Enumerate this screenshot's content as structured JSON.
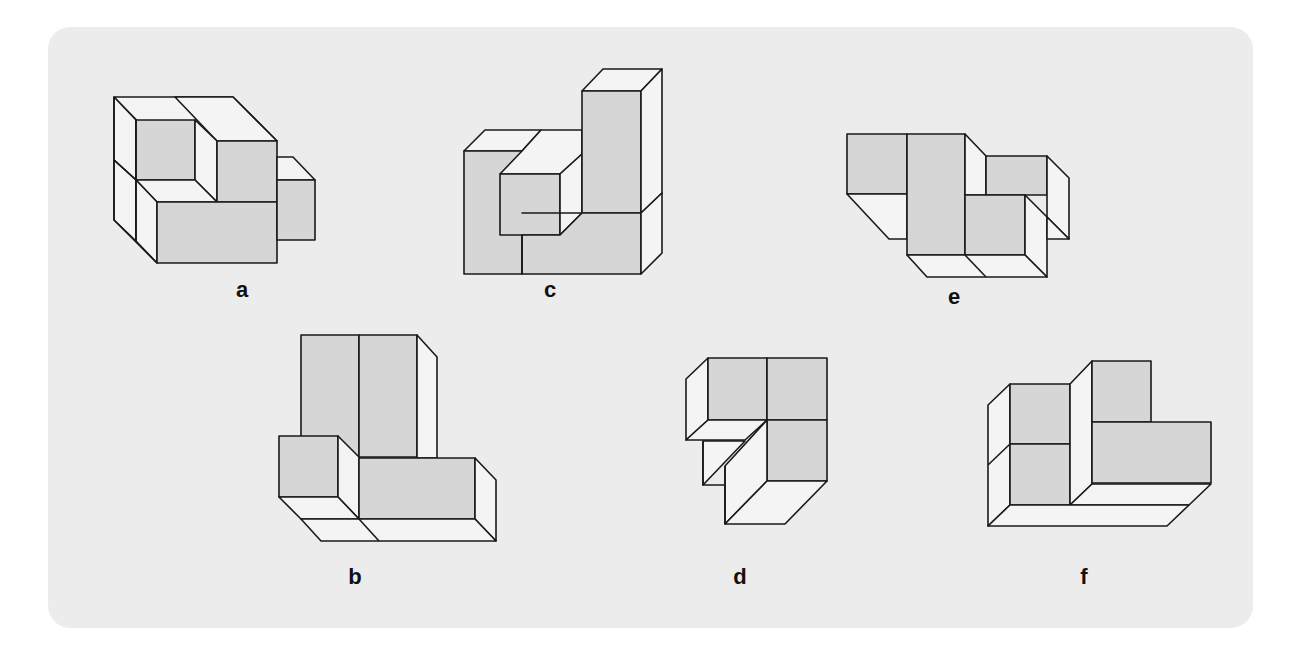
{
  "colors": {
    "panel": "#ececec",
    "gray_face": "#d6d6d6",
    "white_face": "#f4f4f4",
    "stroke": "#1a1a1a"
  },
  "figures": [
    {
      "id": "a",
      "label": "a",
      "label_pos": [
        242,
        290
      ],
      "faces": [
        {
          "fill": "white",
          "pts": "114,97 233,97 277,141 157,141"
        },
        {
          "fill": "white",
          "pts": "114,97 136,120 136,180 114,160"
        },
        {
          "fill": "gray",
          "pts": "136,120 195,120 195,180 136,180"
        },
        {
          "fill": "white",
          "pts": "175,97 233,97 277,141 217,141"
        },
        {
          "fill": "white",
          "pts": "195,120 217,141 217,202 195,180"
        },
        {
          "fill": "gray",
          "pts": "217,141 277,141 277,202 217,202"
        },
        {
          "fill": "white",
          "pts": "114,160 136,180 136,241 114,220"
        },
        {
          "fill": "white",
          "pts": "136,180 195,180 217,202 157,202"
        },
        {
          "fill": "white",
          "pts": "136,180 157,202 157,263 136,241"
        },
        {
          "fill": "gray",
          "pts": "157,202 277,202 277,263 157,263"
        },
        {
          "fill": "white",
          "pts": "277,157 293,157 315,180 277,180"
        },
        {
          "fill": "gray",
          "pts": "277,180 315,180 315,240 277,240"
        }
      ],
      "lines": [
        "114,97 114,220 157,263",
        "136,120 136,241",
        "114,160 136,180"
      ]
    },
    {
      "id": "c",
      "label": "c",
      "label_pos": [
        550,
        290
      ],
      "faces": [
        {
          "fill": "white",
          "pts": "464,151 485,130 541,130 522,151"
        },
        {
          "fill": "gray",
          "pts": "464,151 522,151 522,274 464,274"
        },
        {
          "fill": "white",
          "pts": "541,130 582,130 582,154 560,174 500,174 522,151"
        },
        {
          "fill": "gray",
          "pts": "500,174 560,174 560,235 500,235"
        },
        {
          "fill": "white",
          "pts": "560,174 582,154 582,213 560,235"
        },
        {
          "fill": "white",
          "pts": "582,91 603,69 662,69 641,91"
        },
        {
          "fill": "gray",
          "pts": "582,91 641,91 641,213 582,213"
        },
        {
          "fill": "white",
          "pts": "641,91 662,69 662,193 641,213"
        },
        {
          "fill": "gray",
          "pts": "522,213 641,213 641,274 522,274 522,235 560,235 582,213"
        },
        {
          "fill": "white",
          "pts": "641,213 662,193 662,253 641,274"
        }
      ],
      "lines": [
        "522,235 522,274"
      ]
    },
    {
      "id": "e",
      "label": "e",
      "label_pos": [
        954,
        297
      ],
      "faces": [
        {
          "fill": "gray",
          "pts": "847,134 907,134 907,194 847,194"
        },
        {
          "fill": "white",
          "pts": "847,194 907,194 907,239 889,239"
        },
        {
          "fill": "gray",
          "pts": "907,134 965,134 965,255 907,255"
        },
        {
          "fill": "white",
          "pts": "965,134 986,156 986,195 965,195"
        },
        {
          "fill": "gray",
          "pts": "986,156 1047,156 1047,195 1025,195 986,195"
        },
        {
          "fill": "white",
          "pts": "1047,156 1069,178 1069,239 1047,217"
        },
        {
          "fill": "gray",
          "pts": "965,195 1025,195 1025,255 965,255"
        },
        {
          "fill": "white",
          "pts": "1025,195 1047,217 1047,277 1025,255"
        },
        {
          "fill": "white",
          "pts": "1047,217 1069,239 1047,239"
        },
        {
          "fill": "white",
          "pts": "907,255 1025,255 1047,277 927,277"
        }
      ],
      "lines": [
        "965,255 986,277"
      ]
    },
    {
      "id": "b",
      "label": "b",
      "label_pos": [
        355,
        577
      ],
      "faces": [
        {
          "fill": "gray",
          "pts": "301,335 359,335 359,457 301,457 301,436"
        },
        {
          "fill": "gray",
          "pts": "359,335 417,335 417,457 359,457"
        },
        {
          "fill": "white",
          "pts": "417,335 437,357 437,458 417,458"
        },
        {
          "fill": "gray",
          "pts": "279,436 338,436 338,497 279,497"
        },
        {
          "fill": "white",
          "pts": "338,436 359,457 359,519 338,497"
        },
        {
          "fill": "gray",
          "pts": "359,458 475,458 475,519 359,519"
        },
        {
          "fill": "white",
          "pts": "475,458 496,480 496,541 475,519"
        },
        {
          "fill": "white",
          "pts": "279,497 338,497 359,519 301,519"
        },
        {
          "fill": "white",
          "pts": "301,519 475,519 496,541 321,541"
        }
      ],
      "lines": [
        "359,519 379,541"
      ]
    },
    {
      "id": "d",
      "label": "d",
      "label_pos": [
        740,
        577
      ],
      "faces": [
        {
          "fill": "white",
          "pts": "686,379 708,358 708,420 686,440"
        },
        {
          "fill": "gray",
          "pts": "708,358 767,358 767,420 708,420"
        },
        {
          "fill": "gray",
          "pts": "767,358 827,358 827,420 767,420"
        },
        {
          "fill": "white",
          "pts": "686,440 708,420 767,420 745,440"
        },
        {
          "fill": "gray",
          "pts": "767,420 827,420 827,481 767,481"
        },
        {
          "fill": "white",
          "pts": "703,441 745,441 703,485"
        },
        {
          "fill": "white",
          "pts": "725,466 767,420 767,481 725,524"
        },
        {
          "fill": "white",
          "pts": "725,524 767,481 827,481 785,524"
        }
      ],
      "lines": [
        "703,441 703,485 725,485",
        "725,466 725,524"
      ]
    },
    {
      "id": "f",
      "label": "f",
      "label_pos": [
        1084,
        577
      ],
      "faces": [
        {
          "fill": "white",
          "pts": "988,405 1010,384 1010,505 988,526"
        },
        {
          "fill": "gray",
          "pts": "1010,384 1070,384 1070,444 1010,444"
        },
        {
          "fill": "gray",
          "pts": "1010,444 1070,444 1070,505 1010,505"
        },
        {
          "fill": "white",
          "pts": "1070,384 1092,361 1092,484 1070,505"
        },
        {
          "fill": "gray",
          "pts": "1092,361 1151,361 1151,422 1092,422"
        },
        {
          "fill": "gray",
          "pts": "1092,422 1211,422 1211,483 1092,483"
        },
        {
          "fill": "white",
          "pts": "1070,505 1092,484 1211,484 1189,505"
        },
        {
          "fill": "white",
          "pts": "988,526 1010,505 1189,505 1167,526"
        }
      ],
      "lines": [
        "988,465 1010,444"
      ]
    }
  ]
}
